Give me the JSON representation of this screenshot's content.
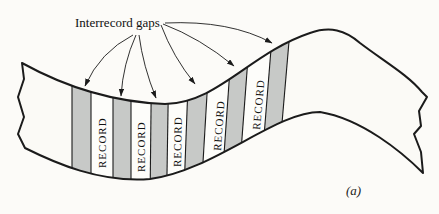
{
  "figure": {
    "title_label": "Interrecord gaps",
    "caption": "(a)",
    "tape": {
      "records": [
        {
          "label": "RECORD"
        },
        {
          "label": "RECORD"
        },
        {
          "label": "RECORD"
        },
        {
          "label": "RECORD"
        },
        {
          "label": "RECORD"
        }
      ],
      "interrecord_gap_count": 6
    },
    "colors": {
      "ink": "#1b1b1b",
      "gap_fill": "#c7c9c7",
      "tape_fill": "#fbfaf6",
      "record_fill": "#fdfdfa",
      "background": "#fcfbf8"
    }
  }
}
